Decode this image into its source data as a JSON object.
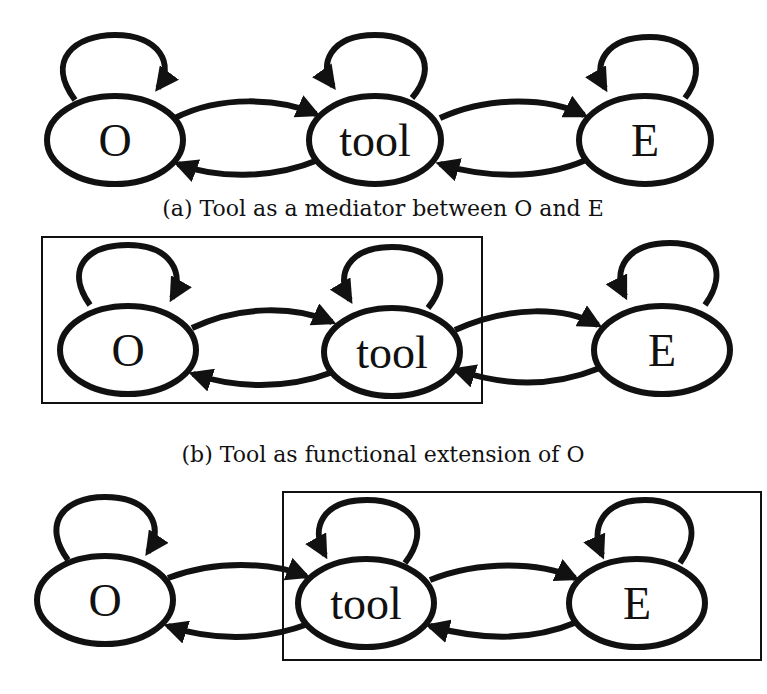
{
  "figure": {
    "panels": [
      {
        "id": "a",
        "caption": "(a) Tool as a mediator between O and E",
        "nodes": [
          {
            "id": "O",
            "label": "O"
          },
          {
            "id": "tool",
            "label": "tool"
          },
          {
            "id": "E",
            "label": "E"
          }
        ],
        "edges": [
          {
            "from": "O",
            "to": "O",
            "type": "self-loop"
          },
          {
            "from": "tool",
            "to": "tool",
            "type": "self-loop"
          },
          {
            "from": "E",
            "to": "E",
            "type": "self-loop"
          },
          {
            "from": "O",
            "to": "tool"
          },
          {
            "from": "tool",
            "to": "O"
          },
          {
            "from": "tool",
            "to": "E"
          },
          {
            "from": "E",
            "to": "tool"
          }
        ],
        "grouping": []
      },
      {
        "id": "b",
        "caption": "(b) Tool as functional extension of O",
        "nodes": [
          {
            "id": "O",
            "label": "O"
          },
          {
            "id": "tool",
            "label": "tool"
          },
          {
            "id": "E",
            "label": "E"
          }
        ],
        "edges": [
          {
            "from": "O",
            "to": "O",
            "type": "self-loop"
          },
          {
            "from": "tool",
            "to": "tool",
            "type": "self-loop"
          },
          {
            "from": "E",
            "to": "E",
            "type": "self-loop"
          },
          {
            "from": "O",
            "to": "tool"
          },
          {
            "from": "tool",
            "to": "O"
          },
          {
            "from": "tool",
            "to": "E"
          },
          {
            "from": "E",
            "to": "tool"
          }
        ],
        "grouping": [
          [
            "O",
            "tool"
          ]
        ]
      },
      {
        "id": "c",
        "caption": "",
        "nodes": [
          {
            "id": "O",
            "label": "O"
          },
          {
            "id": "tool",
            "label": "tool"
          },
          {
            "id": "E",
            "label": "E"
          }
        ],
        "edges": [
          {
            "from": "O",
            "to": "O",
            "type": "self-loop"
          },
          {
            "from": "tool",
            "to": "tool",
            "type": "self-loop"
          },
          {
            "from": "E",
            "to": "E",
            "type": "self-loop"
          },
          {
            "from": "O",
            "to": "tool"
          },
          {
            "from": "tool",
            "to": "O"
          },
          {
            "from": "tool",
            "to": "E"
          },
          {
            "from": "E",
            "to": "tool"
          }
        ],
        "grouping": [
          [
            "tool",
            "E"
          ]
        ]
      }
    ]
  }
}
